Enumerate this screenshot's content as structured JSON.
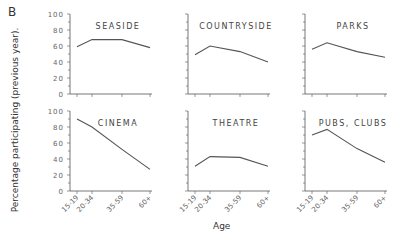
{
  "figure": {
    "panel_letter": "B",
    "ylabel": "Percentage participating (previous year).",
    "xlabel": "Age"
  },
  "chart_data": {
    "type": "line",
    "title": "",
    "xlabel": "Age",
    "ylabel": "Percentage participating (previous year).",
    "categories": [
      "15-19",
      "20-34",
      "35-59",
      "60+"
    ],
    "yticks": [
      0,
      20,
      40,
      60,
      80,
      100
    ],
    "ylim": [
      0,
      100
    ],
    "grid": false,
    "layout": "2x3 small multiples",
    "panels": [
      {
        "name": "SEASIDE",
        "values": [
          59,
          68,
          68,
          58
        ]
      },
      {
        "name": "COUNTRYSIDE",
        "values": [
          49,
          60,
          53,
          40
        ]
      },
      {
        "name": "PARKS",
        "values": [
          56,
          64,
          53,
          46
        ]
      },
      {
        "name": "CINEMA",
        "values": [
          90,
          80,
          52,
          27
        ]
      },
      {
        "name": "THEATRE",
        "values": [
          31,
          43,
          42,
          31
        ]
      },
      {
        "name": "PUBS, CLUBS",
        "values": [
          70,
          77,
          53,
          36
        ]
      }
    ],
    "tick_labels_display": [
      "15-19",
      "20-34",
      "35-59",
      "60+"
    ],
    "line_color": "#555555"
  }
}
